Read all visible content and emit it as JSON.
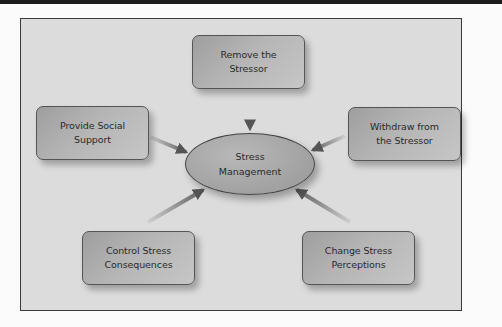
{
  "diagram": {
    "center": {
      "label": "Stress\nManagement"
    },
    "nodes": [
      {
        "id": "remove",
        "label": "Remove the\nStressor"
      },
      {
        "id": "withdraw",
        "label": "Withdraw from\nthe Stressor"
      },
      {
        "id": "change",
        "label": "Change Stress\nPerceptions"
      },
      {
        "id": "control",
        "label": "Control Stress\nConsequences"
      },
      {
        "id": "social",
        "label": "Provide Social\nSupport"
      }
    ],
    "edges": [
      {
        "from": "remove",
        "to": "center"
      },
      {
        "from": "withdraw",
        "to": "center"
      },
      {
        "from": "change",
        "to": "center"
      },
      {
        "from": "control",
        "to": "center"
      },
      {
        "from": "social",
        "to": "center"
      }
    ],
    "colors": {
      "frame_bg": "#dcdcdc",
      "node_fill": "#b0b0b0",
      "arrow": "#707070",
      "border": "#3a3a3a"
    }
  }
}
